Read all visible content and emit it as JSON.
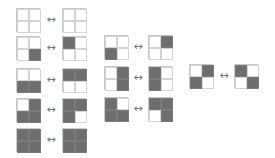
{
  "diagram": {
    "arrow_symbol": "↔",
    "colors": {
      "filled": "#6e6e6e",
      "empty": "#ffffff",
      "border": "#c8c8c8",
      "arrow": "#777777"
    },
    "cell_order": [
      "top-left",
      "top-right",
      "bottom-left",
      "bottom-right"
    ],
    "pairs": [
      {
        "left": {
          "x": 16,
          "y": 8,
          "cells": [
            0,
            0,
            0,
            0
          ]
        },
        "right": {
          "x": 62,
          "y": 8,
          "cells": [
            0,
            0,
            0,
            0
          ]
        },
        "arrow": {
          "x": 44,
          "y": 15
        }
      },
      {
        "left": {
          "x": 16,
          "y": 36,
          "cells": [
            0,
            0,
            0,
            1
          ]
        },
        "right": {
          "x": 62,
          "y": 36,
          "cells": [
            1,
            0,
            0,
            0
          ]
        },
        "arrow": {
          "x": 44,
          "y": 43
        }
      },
      {
        "left": {
          "x": 16,
          "y": 68,
          "cells": [
            0,
            0,
            1,
            1
          ]
        },
        "right": {
          "x": 62,
          "y": 68,
          "cells": [
            1,
            1,
            0,
            0
          ]
        },
        "arrow": {
          "x": 44,
          "y": 75
        }
      },
      {
        "left": {
          "x": 16,
          "y": 98,
          "cells": [
            0,
            1,
            1,
            1
          ]
        },
        "right": {
          "x": 62,
          "y": 98,
          "cells": [
            1,
            1,
            1,
            0
          ]
        },
        "arrow": {
          "x": 44,
          "y": 105
        }
      },
      {
        "left": {
          "x": 16,
          "y": 128,
          "cells": [
            1,
            1,
            1,
            1
          ]
        },
        "right": {
          "x": 62,
          "y": 128,
          "cells": [
            1,
            1,
            1,
            1
          ]
        },
        "arrow": {
          "x": 44,
          "y": 135
        }
      },
      {
        "left": {
          "x": 104,
          "y": 35,
          "cells": [
            0,
            0,
            1,
            0
          ]
        },
        "right": {
          "x": 148,
          "y": 35,
          "cells": [
            0,
            1,
            0,
            0
          ]
        },
        "arrow": {
          "x": 131,
          "y": 42
        }
      },
      {
        "left": {
          "x": 104,
          "y": 66,
          "cells": [
            0,
            1,
            0,
            1
          ]
        },
        "right": {
          "x": 148,
          "y": 66,
          "cells": [
            1,
            0,
            1,
            0
          ]
        },
        "arrow": {
          "x": 131,
          "y": 73
        }
      },
      {
        "left": {
          "x": 104,
          "y": 97,
          "cells": [
            1,
            0,
            1,
            1
          ]
        },
        "right": {
          "x": 148,
          "y": 97,
          "cells": [
            1,
            1,
            0,
            1
          ]
        },
        "arrow": {
          "x": 131,
          "y": 104
        }
      },
      {
        "left": {
          "x": 189,
          "y": 64,
          "cells": [
            0,
            1,
            1,
            0
          ]
        },
        "right": {
          "x": 234,
          "y": 64,
          "cells": [
            1,
            0,
            0,
            1
          ]
        },
        "arrow": {
          "x": 217,
          "y": 71
        }
      }
    ]
  }
}
